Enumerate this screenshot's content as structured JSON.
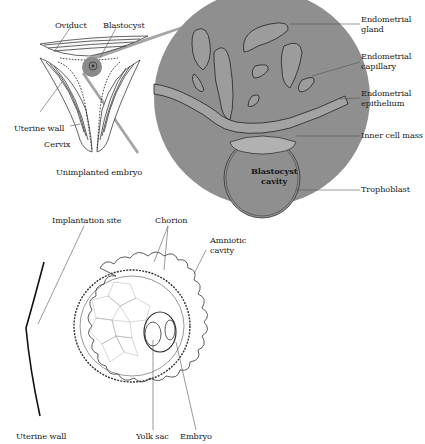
{
  "figure": {
    "top_panel": {
      "caption": "Unimplanted embryo",
      "labels": {
        "oviduct": "Oviduct",
        "blastocyst": "Blastocyst",
        "uterine_wall": "Uterine wall",
        "cervix": "Cervix",
        "endometrial_gland": "Endometrial\ngland",
        "endometrial_capillary": "Endometrial\ncapillary",
        "endometrial_epithelium": "Endometrial\nepithelium",
        "inner_cell_mass": "Inner cell mass",
        "blastocyst_cavity": "Blastocyst\ncavity",
        "trophoblast": "Trophoblast"
      }
    },
    "bottom_panel": {
      "labels": {
        "implantation_site": "Implantation site",
        "chorion": "Chorion",
        "amniotic_cavity": "Amniotic\ncavity",
        "uterine_wall": "Uterine wall",
        "yolk_sac": "Yolk sac",
        "embryo": "Embryo"
      }
    },
    "colors": {
      "magnified_circle": "#8f8f8f",
      "highlight_spot": "#8a8a8a",
      "ink": "#1a1a1a",
      "background": "#ffffff"
    }
  }
}
